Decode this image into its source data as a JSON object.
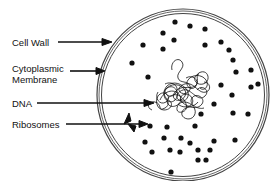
{
  "labels": {
    "cell_wall": "Cell Wall",
    "cytoplasmic_membrane_line1": "Cytoplasmic",
    "cytoplasmic_membrane_line2": "Membrane",
    "dna": "DNA",
    "ribosomes": "Ribosomes"
  },
  "colors": {
    "ink": "#111111",
    "wall": "#555555",
    "background": "#ffffff"
  },
  "cell": {
    "cx": 182,
    "cy": 95,
    "r_outer": 86,
    "r_inner": 82
  },
  "ribosomes": [
    [
      175,
      22
    ],
    [
      190,
      26
    ],
    [
      205,
      29
    ],
    [
      163,
      33
    ],
    [
      174,
      40
    ],
    [
      205,
      45
    ],
    [
      221,
      42
    ],
    [
      143,
      45
    ],
    [
      163,
      49
    ],
    [
      229,
      50
    ],
    [
      132,
      63
    ],
    [
      233,
      60
    ],
    [
      236,
      72
    ],
    [
      148,
      77
    ],
    [
      251,
      70
    ],
    [
      221,
      85
    ],
    [
      258,
      84
    ],
    [
      251,
      87
    ],
    [
      232,
      95
    ],
    [
      214,
      104
    ],
    [
      248,
      114
    ],
    [
      233,
      113
    ],
    [
      201,
      114
    ],
    [
      150,
      126
    ],
    [
      167,
      127
    ],
    [
      195,
      126
    ],
    [
      164,
      138
    ],
    [
      214,
      141
    ],
    [
      181,
      138
    ],
    [
      190,
      143
    ],
    [
      145,
      142
    ],
    [
      235,
      140
    ],
    [
      170,
      150
    ],
    [
      198,
      150
    ],
    [
      152,
      152
    ],
    [
      180,
      152
    ],
    [
      206,
      160
    ],
    [
      171,
      172
    ],
    [
      198,
      160
    ],
    [
      210,
      150
    ]
  ]
}
